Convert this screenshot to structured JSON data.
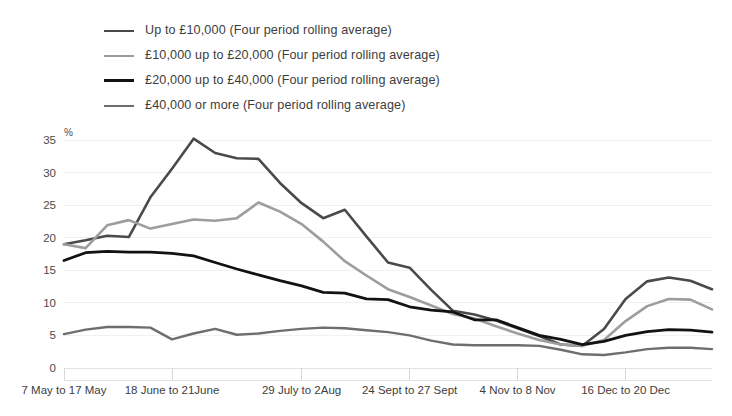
{
  "chart_data": {
    "type": "line",
    "title": "",
    "xlabel": "",
    "ylabel": "%",
    "ylim": [
      0,
      35
    ],
    "yticks": [
      0,
      5,
      10,
      15,
      20,
      25,
      30,
      35
    ],
    "grid": true,
    "legend_position": "top-left",
    "x_tick_labels": [
      "7 May to 17 May",
      "18 June to 21June",
      "29 July to 2Aug",
      "24 Sept to 27 Sept",
      "4 Nov to 8 Nov",
      "16 Dec to 20 Dec"
    ],
    "x_tick_indices": [
      0,
      5,
      11,
      16,
      21,
      26
    ],
    "n_points": 29,
    "series": [
      {
        "name": "Up to £10,000 (Four period rolling average)",
        "color": "#4a4a4a",
        "width": 2.6,
        "values": [
          19.0,
          19.6,
          20.3,
          20.1,
          26.2,
          30.6,
          35.2,
          33.0,
          32.2,
          32.1,
          28.4,
          25.3,
          23.0,
          24.3,
          20.2,
          16.2,
          15.4,
          12.0,
          8.8,
          8.2,
          7.3,
          6.1,
          4.9,
          3.6,
          3.4,
          6.0,
          10.6,
          13.3,
          13.9,
          13.4,
          12.1
        ]
      },
      {
        "name": "£10,000 up to £20,000 (Four period rolling average)",
        "color": "#9d9d9d",
        "width": 2.6,
        "values": [
          19.0,
          18.4,
          21.9,
          22.7,
          21.4,
          22.1,
          22.8,
          22.6,
          23.0,
          25.4,
          24.0,
          22.1,
          19.4,
          16.4,
          14.2,
          12.1,
          10.9,
          9.6,
          8.3,
          7.6,
          6.4,
          5.3,
          4.3,
          3.6,
          3.4,
          4.3,
          7.2,
          9.5,
          10.6,
          10.5,
          9.0
        ]
      },
      {
        "name": "£20,000 up to £40,000 (Four period rolling average)",
        "color": "#121212",
        "width": 2.8,
        "values": [
          16.5,
          17.7,
          17.9,
          17.8,
          17.8,
          17.6,
          17.2,
          16.2,
          15.2,
          14.3,
          13.4,
          12.6,
          11.6,
          11.5,
          10.6,
          10.5,
          9.4,
          8.9,
          8.6,
          7.4,
          7.4,
          6.2,
          5.0,
          4.4,
          3.6,
          4.1,
          5.0,
          5.6,
          5.9,
          5.8,
          5.5
        ]
      },
      {
        "name": "£40,000 or more (Four period rolling average)",
        "color": "#6e6e6e",
        "width": 2.4,
        "values": [
          5.2,
          5.9,
          6.3,
          6.3,
          6.2,
          4.4,
          5.3,
          6.0,
          5.1,
          5.3,
          5.7,
          6.0,
          6.2,
          6.1,
          5.8,
          5.5,
          5.0,
          4.2,
          3.6,
          3.5,
          3.5,
          3.5,
          3.4,
          2.8,
          2.1,
          2.0,
          2.4,
          2.9,
          3.1,
          3.1,
          2.9
        ]
      }
    ]
  },
  "legend": {
    "items": [
      {
        "label": "Up to £10,000 (Four period rolling average)",
        "color": "#4a4a4a",
        "thickness": "2.8px"
      },
      {
        "label": "£10,000 up to £20,000 (Four period rolling average)",
        "color": "#9d9d9d",
        "thickness": "2.6px"
      },
      {
        "label": "£20,000 up to £40,000 (Four period rolling average)",
        "color": "#121212",
        "thickness": "3px"
      },
      {
        "label": "£40,000 or more (Four period rolling average)",
        "color": "#6e6e6e",
        "thickness": "2.6px"
      }
    ]
  }
}
